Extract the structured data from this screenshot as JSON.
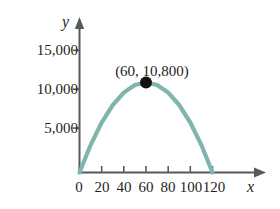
{
  "chart_data": {
    "type": "line",
    "title": "",
    "subtitle": "",
    "xlabel": "x",
    "ylabel": "y",
    "xlim": [
      0,
      130
    ],
    "ylim": [
      0,
      17500
    ],
    "grid": false,
    "legend": null,
    "curve_color": "#7fb5ac",
    "axis_color": "#58595b",
    "marker_color": "#111111",
    "x_ticks": [
      "0",
      "20",
      "40",
      "60",
      "80",
      "100",
      "120"
    ],
    "x_tick_values": [
      0,
      20,
      40,
      60,
      80,
      100,
      120
    ],
    "y_ticks": [
      "5,000",
      "10,000",
      "15,000"
    ],
    "y_tick_values": [
      5000,
      10000,
      15000
    ],
    "series": [
      {
        "name": "parabola",
        "equation_note": "y = 3x(120 - x)",
        "x": [
          0,
          10,
          20,
          30,
          40,
          50,
          60,
          70,
          80,
          90,
          100,
          110,
          120
        ],
        "values": [
          0,
          3300,
          6000,
          8100,
          9600,
          10500,
          10800,
          10500,
          9600,
          8100,
          6000,
          3300,
          0
        ]
      }
    ],
    "annotations": [
      {
        "label": "(60, 10,800)",
        "x": 60,
        "y": 10800,
        "marker": "filled-circle"
      }
    ]
  },
  "axis_names": {
    "x": "x",
    "y": "y"
  }
}
